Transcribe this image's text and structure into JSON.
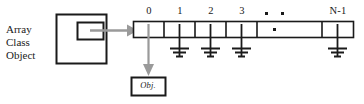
{
  "diagram": {
    "colors": {
      "stroke": "#1a1a1a",
      "pointer": "#9a9a9a",
      "background": "#ffffff",
      "text": "#1a1a1a"
    },
    "source_box": {
      "label_lines": [
        "Array",
        "Class",
        "Object"
      ],
      "label_text": "Array Class Object"
    },
    "array": {
      "index_labels": [
        "0",
        "1",
        "2",
        "3",
        "N-1"
      ],
      "ellipsis_top": "▪  ▪",
      "ellipsis_inner": "▪",
      "cell_count": 5,
      "null_cells": [
        "1",
        "2",
        "3",
        "N-1"
      ],
      "linked_cell": "0"
    },
    "object_box": {
      "label": "Obj."
    }
  }
}
